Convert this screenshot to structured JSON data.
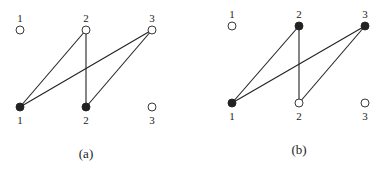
{
  "panels": [
    {
      "caption": "(a)",
      "top_nodes": [
        {
          "label": "1",
          "filled": false
        },
        {
          "label": "2",
          "filled": false
        },
        {
          "label": "3",
          "filled": false
        }
      ],
      "bottom_nodes": [
        {
          "label": "1",
          "filled": true
        },
        {
          "label": "2",
          "filled": true
        },
        {
          "label": "3",
          "filled": false
        }
      ],
      "edges": [
        {
          "top": 2,
          "bottom": 1
        },
        {
          "top": 2,
          "bottom": 2
        },
        {
          "top": 3,
          "bottom": 1
        },
        {
          "top": 3,
          "bottom": 2
        }
      ]
    },
    {
      "caption": "(b)",
      "top_nodes": [
        {
          "label": "1",
          "filled": false
        },
        {
          "label": "2",
          "filled": true
        },
        {
          "label": "3",
          "filled": true
        }
      ],
      "bottom_nodes": [
        {
          "label": "1",
          "filled": true
        },
        {
          "label": "2",
          "filled": false
        },
        {
          "label": "3",
          "filled": false
        }
      ],
      "edges": [
        {
          "top": 2,
          "bottom": 1
        },
        {
          "top": 2,
          "bottom": 2
        },
        {
          "top": 3,
          "bottom": 1
        },
        {
          "top": 3,
          "bottom": 2
        }
      ]
    }
  ],
  "colors": {
    "ink": "#222222",
    "background": "#ffffff"
  }
}
